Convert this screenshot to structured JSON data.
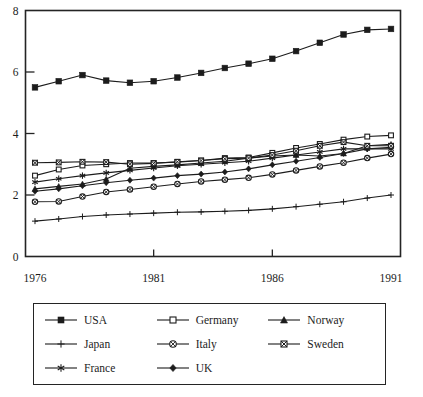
{
  "chart_data": {
    "type": "line",
    "title": "",
    "xlabel": "",
    "ylabel": "",
    "x": [
      1976,
      1977,
      1978,
      1979,
      1980,
      1981,
      1982,
      1983,
      1984,
      1985,
      1986,
      1987,
      1988,
      1989,
      1990,
      1991
    ],
    "xlim": [
      1975.6,
      1991.4
    ],
    "ylim": [
      0,
      8
    ],
    "x_ticks": [
      "1976",
      "1981",
      "1986",
      "1991"
    ],
    "x_tick_values": [
      1976,
      1981,
      1986,
      1991
    ],
    "y_ticks": [
      "0",
      "2",
      "4",
      "6",
      "8"
    ],
    "y_tick_values": [
      0,
      2,
      4,
      6,
      8
    ],
    "grid": false,
    "legend_position": "below-plot",
    "series": [
      {
        "name": "USA",
        "marker": "filled-square",
        "color": "#1c1c1c",
        "values": [
          5.5,
          5.7,
          5.9,
          5.72,
          5.65,
          5.7,
          5.82,
          5.97,
          6.13,
          6.27,
          6.43,
          6.68,
          6.95,
          7.22,
          7.37,
          7.4
        ]
      },
      {
        "name": "Germany",
        "marker": "open-square",
        "color": "#1c1c1c",
        "values": [
          2.63,
          2.83,
          2.96,
          3.0,
          3.04,
          3.04,
          3.07,
          3.12,
          3.2,
          3.22,
          3.37,
          3.53,
          3.66,
          3.8,
          3.9,
          3.94
        ]
      },
      {
        "name": "Norway",
        "marker": "filled-triangle",
        "color": "#1c1c1c",
        "values": [
          2.2,
          2.28,
          2.36,
          2.52,
          2.87,
          2.93,
          2.98,
          3.04,
          3.1,
          3.2,
          3.27,
          3.3,
          3.27,
          3.35,
          3.6,
          3.65
        ]
      },
      {
        "name": "Japan",
        "marker": "plus",
        "color": "#1c1c1c",
        "values": [
          1.15,
          1.22,
          1.3,
          1.35,
          1.38,
          1.41,
          1.44,
          1.45,
          1.47,
          1.5,
          1.55,
          1.62,
          1.7,
          1.78,
          1.9,
          2.0
        ]
      },
      {
        "name": "Italy",
        "marker": "circle-cross",
        "color": "#1c1c1c",
        "values": [
          1.78,
          1.79,
          1.95,
          2.1,
          2.18,
          2.27,
          2.36,
          2.44,
          2.5,
          2.56,
          2.67,
          2.8,
          2.93,
          3.05,
          3.2,
          3.33
        ]
      },
      {
        "name": "Sweden",
        "marker": "square-cross",
        "color": "#1c1c1c",
        "values": [
          3.05,
          3.06,
          3.08,
          3.07,
          3.0,
          3.03,
          3.08,
          3.12,
          3.18,
          3.2,
          3.3,
          3.44,
          3.6,
          3.72,
          3.6,
          3.6
        ]
      },
      {
        "name": "France",
        "marker": "asterisk",
        "color": "#1c1c1c",
        "values": [
          2.42,
          2.53,
          2.63,
          2.72,
          2.8,
          2.88,
          2.95,
          3.0,
          3.05,
          3.1,
          3.2,
          3.3,
          3.4,
          3.5,
          3.5,
          3.5
        ]
      },
      {
        "name": "UK",
        "marker": "filled-diamond",
        "color": "#1c1c1c",
        "values": [
          2.12,
          2.2,
          2.3,
          2.4,
          2.48,
          2.55,
          2.63,
          2.68,
          2.75,
          2.85,
          2.98,
          3.1,
          3.22,
          3.35,
          3.5,
          3.55
        ]
      }
    ]
  },
  "legend": {
    "entries": [
      {
        "label": "USA",
        "marker": "filled-square"
      },
      {
        "label": "Germany",
        "marker": "open-square"
      },
      {
        "label": "Norway",
        "marker": "filled-triangle"
      },
      {
        "label": "Japan",
        "marker": "plus"
      },
      {
        "label": "Italy",
        "marker": "circle-cross"
      },
      {
        "label": "Sweden",
        "marker": "square-cross"
      },
      {
        "label": "France",
        "marker": "asterisk"
      },
      {
        "label": "UK",
        "marker": "filled-diamond"
      }
    ]
  },
  "axes": {
    "y_labels": [
      "8",
      "6",
      "4",
      "2",
      "0"
    ],
    "x_labels": [
      "1976",
      "1981",
      "1986",
      "1991"
    ]
  }
}
